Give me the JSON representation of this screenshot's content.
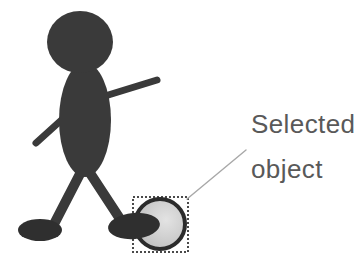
{
  "canvas": {
    "width": 360,
    "height": 266,
    "background_color": "#ffffff"
  },
  "annotation": {
    "label_line_1": "Selected",
    "label_line_2": "object",
    "text_color": "#595959",
    "leader_line_color": "#a8a8a8"
  },
  "figure": {
    "name": "stick-figure",
    "body_color": "#3a3a3a",
    "parts": {
      "head": "head",
      "torso": "torso",
      "arm_upper_right": "raised-arm",
      "arm_lower_left": "lowered-arm",
      "leg_left": "left-leg",
      "leg_right": "right-leg",
      "foot_left": "left-foot",
      "foot_right": "right-foot"
    }
  },
  "selected_object": {
    "name": "ball",
    "fill_color": "#c9c9c9",
    "outline_color": "#2b2b2b",
    "highlight_color": "#e4e4e4",
    "selection_box": {
      "border_style": "dashed",
      "border_color": "#4a4a4a"
    }
  }
}
